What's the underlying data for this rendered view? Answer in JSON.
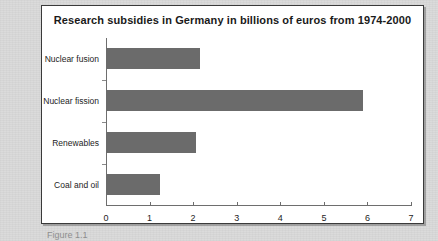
{
  "figure": {
    "caption": "Figure 1.1"
  },
  "colors": {
    "bar_fill": "#6b6b6b",
    "frame_background": "#ffffff",
    "page_background": "#d9d9d9",
    "axis": "#6e6e6e",
    "text": "#1d1d1d"
  },
  "chart_data": {
    "type": "bar",
    "orientation": "horizontal",
    "title": "Research subsidies in Germany in billions of euros from 1974-2000",
    "xlabel": "",
    "ylabel": "",
    "categories": [
      "Nuclear fusion",
      "Nuclear fission",
      "Renewables",
      "Coal and oil"
    ],
    "values": [
      2.15,
      5.9,
      2.07,
      1.24
    ],
    "series": [
      {
        "name": "Research subsidies (billions of euros)",
        "values": [
          2.15,
          5.9,
          2.07,
          1.24
        ]
      }
    ],
    "xlim": [
      0,
      7
    ],
    "xticks": [
      0,
      1,
      2,
      3,
      4,
      5,
      6,
      7
    ],
    "xtick_labels": [
      "0",
      "1",
      "2",
      "3",
      "4",
      "5",
      "6",
      "7"
    ],
    "grid": false,
    "legend": false,
    "units": "billions of euros",
    "period": "1974-2000"
  }
}
